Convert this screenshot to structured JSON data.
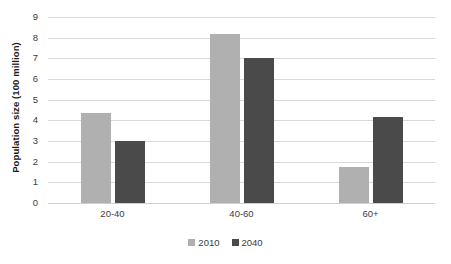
{
  "chart_data": {
    "type": "bar",
    "title": "",
    "xlabel": "",
    "ylabel": "Population size (100 million)",
    "categories": [
      "20-40",
      "40-60",
      "60+"
    ],
    "series": [
      {
        "name": "2010",
        "color": "#b0b0b0",
        "values": [
          4.35,
          8.2,
          1.75
        ]
      },
      {
        "name": "2040",
        "color": "#4a4a4a",
        "values": [
          3.0,
          7.0,
          4.15
        ]
      }
    ],
    "ylim": [
      0,
      9
    ],
    "ytick_step": 1,
    "yticks": [
      "9",
      "8",
      "7",
      "6",
      "5",
      "4",
      "3",
      "2",
      "1",
      "0"
    ],
    "grid": true,
    "grid_axis": "y",
    "legend_position": "bottom-center"
  },
  "colors": {
    "series_2010": "#b0b0b0",
    "series_2040": "#4a4a4a",
    "gridline": "#d9d9d9",
    "text": "#3c3c3c",
    "axis_title": "#1a1a1a",
    "background": "#ffffff"
  }
}
